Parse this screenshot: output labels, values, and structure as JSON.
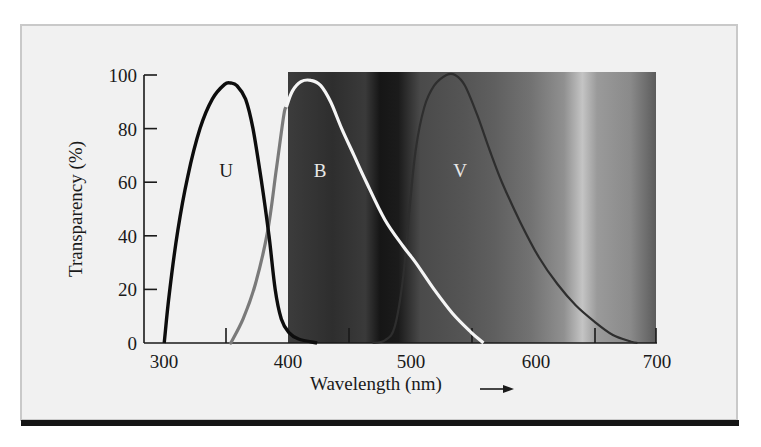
{
  "chart_data": {
    "type": "line",
    "title": "",
    "xlabel": "Wavelength (nm)",
    "ylabel": "Transparency (%)",
    "xlim": [
      290,
      700
    ],
    "ylim": [
      0,
      100
    ],
    "x_ticks": [
      300,
      400,
      500,
      600,
      700
    ],
    "x_minor_ticks": [
      350,
      450,
      550,
      650
    ],
    "y_ticks": [
      0,
      20,
      40,
      60,
      80,
      100
    ],
    "grid": false,
    "legend": "inline labels",
    "background_band": {
      "from_nm": 400,
      "to_nm": 700,
      "description": "grayscale visible-spectrum gradient"
    },
    "series": [
      {
        "name": "U",
        "color": "#111111",
        "points": [
          [
            301,
            0
          ],
          [
            305,
            18
          ],
          [
            312,
            42
          ],
          [
            320,
            62
          ],
          [
            330,
            80
          ],
          [
            340,
            91
          ],
          [
            350,
            96.5
          ],
          [
            355,
            97
          ],
          [
            360,
            96
          ],
          [
            367,
            91
          ],
          [
            373,
            80
          ],
          [
            380,
            60
          ],
          [
            386,
            40
          ],
          [
            391,
            20
          ],
          [
            396,
            9
          ],
          [
            402,
            4
          ],
          [
            410,
            1.5
          ],
          [
            425,
            0
          ]
        ]
      },
      {
        "name": "B",
        "color": "#ffffff",
        "pre_400_color": "#7a7a7a",
        "points": [
          [
            355,
            0
          ],
          [
            365,
            9
          ],
          [
            375,
            22
          ],
          [
            385,
            42
          ],
          [
            392,
            65
          ],
          [
            398,
            85
          ],
          [
            400,
            88
          ],
          [
            405,
            94
          ],
          [
            412,
            97.5
          ],
          [
            420,
            98
          ],
          [
            428,
            96
          ],
          [
            436,
            90
          ],
          [
            445,
            80
          ],
          [
            455,
            70
          ],
          [
            465,
            60
          ],
          [
            480,
            46
          ],
          [
            495,
            36
          ],
          [
            505,
            30
          ],
          [
            520,
            20
          ],
          [
            535,
            11
          ],
          [
            550,
            4
          ],
          [
            560,
            0
          ]
        ]
      },
      {
        "name": "V",
        "color": "#333333",
        "points": [
          [
            470,
            0
          ],
          [
            480,
            1
          ],
          [
            488,
            6
          ],
          [
            495,
            25
          ],
          [
            500,
            50
          ],
          [
            505,
            72
          ],
          [
            512,
            88
          ],
          [
            520,
            96
          ],
          [
            530,
            100
          ],
          [
            537,
            100
          ],
          [
            545,
            96
          ],
          [
            555,
            85
          ],
          [
            565,
            72
          ],
          [
            575,
            60
          ],
          [
            590,
            45
          ],
          [
            605,
            32
          ],
          [
            620,
            22
          ],
          [
            635,
            14
          ],
          [
            650,
            8
          ],
          [
            665,
            3
          ],
          [
            680,
            0.5
          ],
          [
            685,
            0
          ]
        ]
      }
    ],
    "annotations": [
      {
        "text": "U",
        "x_nm": 352,
        "y": 63
      },
      {
        "text": "B",
        "x_nm": 427,
        "y": 63
      },
      {
        "text": "V",
        "x_nm": 537,
        "y": 63
      }
    ]
  },
  "labels": {
    "ylabel": "Transparency (%)",
    "xlabel": "Wavelength (nm)",
    "arrow": "→",
    "x_ticks": [
      "300",
      "400",
      "500",
      "600",
      "700"
    ],
    "y_ticks": [
      "0",
      "20",
      "40",
      "60",
      "80",
      "100"
    ],
    "band_u": "U",
    "band_b": "B",
    "band_v": "V"
  }
}
